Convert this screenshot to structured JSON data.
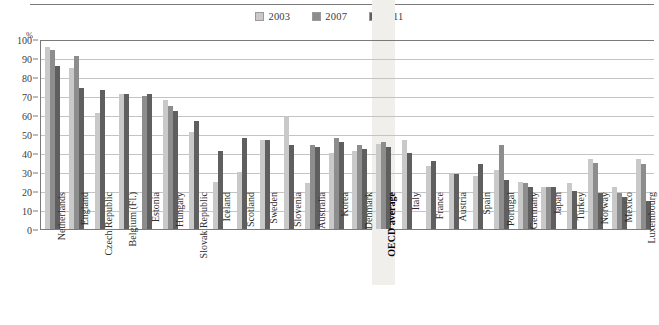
{
  "chart_data": {
    "type": "bar",
    "title": "",
    "xlabel": "",
    "ylabel": "%",
    "ylim": [
      0,
      100
    ],
    "ytick_step": 10,
    "yticks": [
      0,
      10,
      20,
      30,
      40,
      50,
      60,
      70,
      80,
      90,
      100
    ],
    "grid": true,
    "legend_position": "top-center",
    "highlight_category": "OECD average",
    "categories": [
      "Netherlands",
      "England",
      "Czech Republic",
      "Belgium (Fl.)",
      "Estonia",
      "Hungary",
      "Slovak Republic",
      "Iceland",
      "Scotland",
      "Sweden",
      "Slovenia",
      "Australia",
      "Korea",
      "Denmark",
      "OECD average",
      "Italy",
      "France",
      "Austria",
      "Spain",
      "Portugal",
      "Germany",
      "Japan",
      "Turkey",
      "Norway",
      "Mexico",
      "Luxembourg"
    ],
    "series": [
      {
        "name": "2003",
        "color": "#c9c9c9",
        "values": [
          96,
          85,
          61,
          71,
          null,
          68,
          51,
          25,
          30,
          47,
          59,
          24,
          40,
          41,
          45,
          47,
          33,
          29,
          28,
          31,
          25,
          22,
          24,
          37,
          22,
          37
        ]
      },
      {
        "name": "2007",
        "color": "#8d8d8d",
        "values": [
          94,
          91,
          null,
          null,
          70,
          65,
          null,
          null,
          null,
          null,
          null,
          44,
          48,
          44,
          46,
          null,
          null,
          null,
          null,
          44,
          24,
          22,
          null,
          35,
          19,
          34
        ]
      },
      {
        "name": "2011",
        "color": "#5f5f5f",
        "values": [
          86,
          74,
          73,
          71,
          71,
          62,
          57,
          41,
          48,
          47,
          44,
          43,
          46,
          42,
          43,
          40,
          36,
          29,
          34,
          26,
          22,
          22,
          20,
          19,
          17,
          15
        ]
      }
    ]
  },
  "legend": {
    "items": [
      {
        "label": "2003",
        "color": "#c9c9c9"
      },
      {
        "label": "2007",
        "color": "#8d8d8d"
      },
      {
        "label": "2011",
        "color": "#5f5f5f"
      }
    ]
  },
  "axis": {
    "unit_label": "%"
  }
}
